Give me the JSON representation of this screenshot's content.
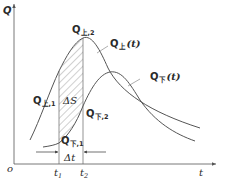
{
  "diagram": {
    "axes": {
      "y_label": "Q",
      "x_label": "t",
      "origin_label": "o"
    },
    "curves": {
      "upper": {
        "name": "Q",
        "sub": "上",
        "arg": "(t)"
      },
      "lower": {
        "name": "Q",
        "sub": "下",
        "arg": "(t)"
      }
    },
    "points": {
      "q_upper_2": {
        "name": "Q",
        "sub": "上,2"
      },
      "q_upper_1": {
        "name": "Q",
        "sub": "上,1"
      },
      "q_lower_2": {
        "name": "Q",
        "sub": "下,2"
      },
      "q_lower_1": {
        "name": "Q",
        "sub": "下,1"
      }
    },
    "area_label": "ΔS",
    "interval_label": "Δt",
    "ticks": {
      "t1": {
        "name": "t",
        "sub": "1"
      },
      "t2": {
        "name": "t",
        "sub": "2"
      }
    },
    "colors": {
      "line": "#555555",
      "hatch": "#777777",
      "text": "#2a2a2a"
    }
  }
}
